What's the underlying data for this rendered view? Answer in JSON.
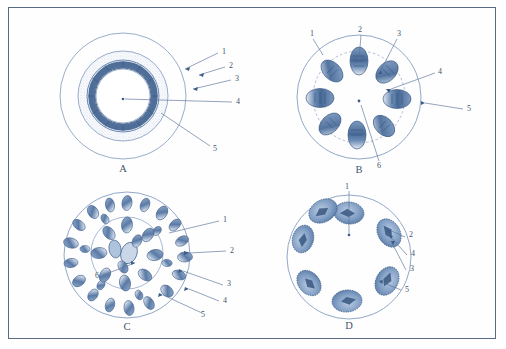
{
  "figure": {
    "frame_color": "#5b6b86",
    "ink_color": "#4a6b9a",
    "background": "#ffffff",
    "panel_count": 4
  },
  "panels": [
    {
      "id": "A",
      "caption": "A",
      "description": "Concentric ring cross-section with stippled cortex and dark vascular ring",
      "structure": "concentric-rings",
      "bundle_count": 0,
      "labels": [
        {
          "number": "1",
          "x": 205,
          "y": 38
        },
        {
          "number": "2",
          "x": 212,
          "y": 52
        },
        {
          "number": "3",
          "x": 218,
          "y": 65
        },
        {
          "number": "4",
          "x": 219,
          "y": 88
        },
        {
          "number": "5",
          "x": 196,
          "y": 136
        }
      ]
    },
    {
      "id": "B",
      "caption": "B",
      "description": "Ring of eight discrete vascular bundles with dashed endodermis",
      "structure": "ring-of-bundles",
      "bundle_count": 8,
      "labels": [
        {
          "number": "1",
          "x": 56,
          "y": 20
        },
        {
          "number": "2",
          "x": 104,
          "y": 16
        },
        {
          "number": "3",
          "x": 143,
          "y": 20
        },
        {
          "number": "4",
          "x": 183,
          "y": 58
        },
        {
          "number": "5",
          "x": 212,
          "y": 95
        },
        {
          "number": "6",
          "x": 124,
          "y": 152
        }
      ]
    },
    {
      "id": "C",
      "caption": "C",
      "description": "Scattered vascular bundles throughout ground tissue, two concentric boundaries",
      "structure": "scattered-bundles",
      "bundle_count": 38,
      "labels": [
        {
          "number": "1",
          "x": 206,
          "y": 44
        },
        {
          "number": "2",
          "x": 213,
          "y": 74
        },
        {
          "number": "3",
          "x": 210,
          "y": 108
        },
        {
          "number": "4",
          "x": 206,
          "y": 124
        },
        {
          "number": "5",
          "x": 188,
          "y": 140
        },
        {
          "number": "6",
          "x": 82,
          "y": 98
        }
      ]
    },
    {
      "id": "D",
      "caption": "D",
      "description": "Seven large oval bundles arranged in a single peripheral ring",
      "structure": "ring-of-large-bundles",
      "bundle_count": 7,
      "labels": [
        {
          "number": "1",
          "x": 89,
          "y": 13
        },
        {
          "number": "2",
          "x": 153,
          "y": 59
        },
        {
          "number": "4",
          "x": 156,
          "y": 78
        },
        {
          "number": "3",
          "x": 155,
          "y": 92
        },
        {
          "number": "5",
          "x": 150,
          "y": 112
        }
      ]
    }
  ]
}
